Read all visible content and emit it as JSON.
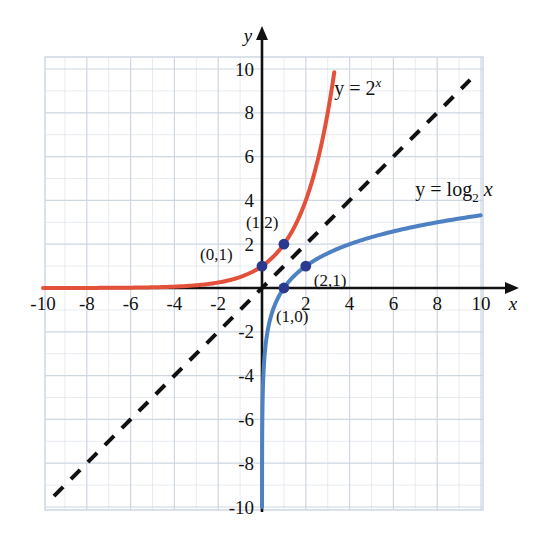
{
  "chart_data": {
    "type": "line",
    "title": "",
    "subtitle": "",
    "xlabel": "x",
    "ylabel": "y",
    "xlim": [
      -10,
      10
    ],
    "ylim": [
      -10,
      10
    ],
    "grid": true,
    "grid_step": 1,
    "major_step": 2,
    "legend_position": "inline-annotations",
    "xticks": [
      -10,
      -8,
      -6,
      -4,
      -2,
      2,
      4,
      6,
      8,
      10
    ],
    "xtick_labels": [
      "-10",
      "-8",
      "-6",
      "-4",
      "-2",
      "2",
      "4",
      "6",
      "8",
      "10"
    ],
    "yticks": [
      -10,
      -8,
      -6,
      -4,
      -2,
      2,
      4,
      6,
      8,
      10
    ],
    "ytick_labels": [
      "-10",
      "-8",
      "-6",
      "-4",
      "-2",
      "2",
      "4",
      "6",
      "8",
      "10"
    ],
    "series": [
      {
        "name": "y = 2^x",
        "label_html": "y = 2",
        "label_sup": "x",
        "color": "#e3513a",
        "style": "solid",
        "width": 4,
        "domain": [
          -10,
          3.33
        ],
        "x": [
          -10,
          -9,
          -8,
          -7,
          -6,
          -5,
          -4,
          -3,
          -2,
          -1,
          0,
          1,
          2,
          2.5,
          3,
          3.32
        ],
        "values": [
          0.001,
          0.002,
          0.004,
          0.008,
          0.016,
          0.031,
          0.063,
          0.125,
          0.25,
          0.5,
          1,
          2,
          4,
          5.66,
          8,
          10
        ]
      },
      {
        "name": "y = log2 x",
        "label_html": "y = log",
        "label_sub": "2",
        "label_tail": "x",
        "color": "#4e80c4",
        "style": "solid",
        "width": 4,
        "domain": [
          0.00098,
          10
        ],
        "x": [
          0.00098,
          0.002,
          0.004,
          0.0078,
          0.0156,
          0.031,
          0.0625,
          0.125,
          0.25,
          0.5,
          1,
          2,
          3,
          4,
          5,
          6,
          7,
          8,
          9,
          10
        ],
        "values": [
          -10,
          -9,
          -8,
          -7,
          -6,
          -5,
          -4,
          -3,
          -2,
          -1,
          0,
          1,
          1.585,
          2,
          2.322,
          2.585,
          2.807,
          3,
          3.17,
          3.322
        ]
      },
      {
        "name": "y = x",
        "color": "#111111",
        "style": "dashed",
        "width": 4,
        "x": [
          -9.5,
          9.5
        ],
        "values": [
          -9.5,
          9.5
        ]
      }
    ],
    "points": [
      {
        "label": "(0,1)",
        "x": 0,
        "y": 1,
        "label_dx": -62,
        "label_dy": -6,
        "color": "#2b3a8f"
      },
      {
        "label": "(1,2)",
        "x": 1,
        "y": 2,
        "label_dx": -38,
        "label_dy": -16,
        "color": "#2b3a8f"
      },
      {
        "label": "(2,1)",
        "x": 2,
        "y": 1,
        "label_dx": 8,
        "label_dy": 20,
        "color": "#2b3a8f"
      },
      {
        "label": "(1,0)",
        "x": 1,
        "y": 0,
        "label_dx": -8,
        "label_dy": 34,
        "color": "#2b3a8f"
      }
    ],
    "annotations": [
      {
        "name": "exp-curve-label",
        "x": 3.3,
        "y": 8.8
      },
      {
        "name": "log-curve-label",
        "x": 7.0,
        "y": 4.2
      }
    ],
    "colors": {
      "grid": "#ccd5e2",
      "axis": "#111111",
      "background": "#ffffff",
      "exponential": "#e3513a",
      "logarithm": "#4e80c4",
      "identity": "#111111",
      "point": "#2b3a8f"
    }
  }
}
